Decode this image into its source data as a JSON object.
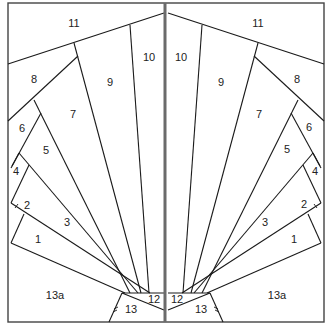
{
  "diagram": {
    "title": "",
    "colors": {
      "line": "#1a1a1a",
      "border": "#444444",
      "center_divider": "#6b6b6b",
      "background": "#ffffff"
    },
    "left": {
      "labels": [
        {
          "id": "11",
          "text": "11"
        },
        {
          "id": "10",
          "text": "10"
        },
        {
          "id": "9",
          "text": "9"
        },
        {
          "id": "8",
          "text": "8"
        },
        {
          "id": "7",
          "text": "7"
        },
        {
          "id": "6",
          "text": "6"
        },
        {
          "id": "5",
          "text": "5"
        },
        {
          "id": "4",
          "text": "4"
        },
        {
          "id": "3",
          "text": "3"
        },
        {
          "id": "2",
          "text": "2"
        },
        {
          "id": "1",
          "text": "1"
        },
        {
          "id": "13a",
          "text": "13a"
        },
        {
          "id": "12",
          "text": "12"
        },
        {
          "id": "13",
          "text": "13"
        }
      ]
    },
    "right": {
      "labels": [
        {
          "id": "11",
          "text": "11"
        },
        {
          "id": "10",
          "text": "10"
        },
        {
          "id": "9",
          "text": "9"
        },
        {
          "id": "8",
          "text": "8"
        },
        {
          "id": "7",
          "text": "7"
        },
        {
          "id": "6",
          "text": "6"
        },
        {
          "id": "5",
          "text": "5"
        },
        {
          "id": "4",
          "text": "4"
        },
        {
          "id": "3",
          "text": "3"
        },
        {
          "id": "2",
          "text": "2"
        },
        {
          "id": "1",
          "text": "1"
        },
        {
          "id": "13a",
          "text": "13a"
        },
        {
          "id": "12",
          "text": "12"
        },
        {
          "id": "13",
          "text": "13"
        }
      ]
    }
  }
}
